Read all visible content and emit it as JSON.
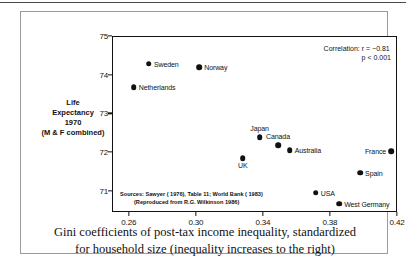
{
  "chart_data": {
    "type": "scatter",
    "title": "",
    "xlabel": "Gini coefficients of post-tax income inequality, standardized for household size (inequality increases to the right)",
    "ylabel": "Life Expectancy 1970 (M & F combined)",
    "xlim": [
      0.25,
      0.42
    ],
    "ylim": [
      70.45,
      75.0
    ],
    "xticks": [
      "0.26",
      "0.30",
      "0.34",
      "0.38",
      "0.42"
    ],
    "xtick_values": [
      0.26,
      0.3,
      0.34,
      0.38,
      0.42
    ],
    "yticks": [
      "75",
      "74",
      "73",
      "72",
      "71"
    ],
    "ytick_values": [
      75,
      74,
      73,
      72,
      71
    ],
    "grid": false,
    "legend": "none",
    "points": [
      {
        "label": "Sweden",
        "x": 0.272,
        "y": 74.28,
        "label_pos": "right"
      },
      {
        "label": "Norway",
        "x": 0.302,
        "y": 74.2,
        "label_pos": "right"
      },
      {
        "label": "Netherlands",
        "x": 0.263,
        "y": 73.68,
        "label_pos": "right"
      },
      {
        "label": "Japan",
        "x": 0.338,
        "y": 72.38,
        "label_pos": "above"
      },
      {
        "label": "Canada",
        "x": 0.349,
        "y": 72.17,
        "label_pos": "above"
      },
      {
        "label": "Australia",
        "x": 0.356,
        "y": 72.05,
        "label_pos": "right"
      },
      {
        "label": "France",
        "x": 0.4165,
        "y": 72.02,
        "label_pos": "left"
      },
      {
        "label": "UK",
        "x": 0.328,
        "y": 71.84,
        "label_pos": "below"
      },
      {
        "label": "Spain",
        "x": 0.398,
        "y": 71.47,
        "label_pos": "right"
      },
      {
        "label": "USA",
        "x": 0.3715,
        "y": 70.95,
        "label_pos": "right"
      },
      {
        "label": "West Germany",
        "x": 0.3855,
        "y": 70.66,
        "label_pos": "right"
      }
    ],
    "annotations": {
      "correlation_line1": "Correlation:  r  =  −0.81",
      "correlation_line2": "p  <  0.001",
      "sources_line1": "Sources:  Sawyer ( 1976), Table 11; World Bank ( 1983)",
      "sources_line2": "(Reproduced from R.G. Wilkinson 1986)"
    },
    "correlation_r": -0.81,
    "p_value": "< 0.001"
  },
  "axis_title": {
    "line1": "Life",
    "line2": "Expectancy",
    "line3": "1970",
    "line4": "(M & F combined)"
  },
  "caption": {
    "line1": "Gini coefficients of post-tax income inequality, standardized",
    "line2": "for household size (inequality increases to the right)"
  }
}
